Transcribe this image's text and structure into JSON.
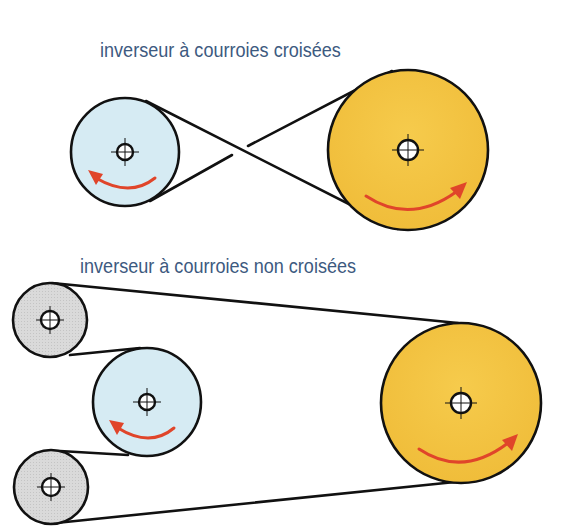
{
  "diagram": {
    "type": "belt-drive-reverser",
    "sections": [
      {
        "id": "crossed",
        "caption": "inverseur à courroies croisées",
        "pulleys": [
          {
            "role": "driver",
            "color": "#d6ebf3",
            "rotation": "counter-clockwise"
          },
          {
            "role": "driven",
            "color": "#f4c542",
            "rotation": "clockwise"
          }
        ],
        "belt": "crossed"
      },
      {
        "id": "uncrossed",
        "caption": "inverseur à courroies non croisées",
        "pulleys": [
          {
            "role": "idler-top",
            "color": "#d9d9d9"
          },
          {
            "role": "driver",
            "color": "#d6ebf3",
            "rotation": "counter-clockwise"
          },
          {
            "role": "idler-bottom",
            "color": "#d9d9d9"
          },
          {
            "role": "driven",
            "color": "#f4c542",
            "rotation": "clockwise"
          }
        ],
        "belt": "open"
      }
    ],
    "colors": {
      "caption_text": "#3d5a80",
      "driver_pulley": "#d6ebf3",
      "driven_pulley": "#f4c542",
      "idler_pulley": "#d9d9d9",
      "rotation_arrow": "#e0452a",
      "belt": "#111111"
    }
  }
}
